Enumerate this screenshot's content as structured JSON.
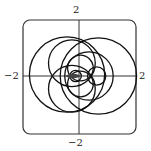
{
  "chart_data": {
    "type": "line",
    "title": "",
    "xlabel": "",
    "ylabel": "",
    "xlim": [
      -2,
      2
    ],
    "ylim": [
      -2,
      2
    ],
    "grid": false,
    "legend": null,
    "tick_labels": {
      "x_min": "−2",
      "x_max": "2",
      "y_min": "−2",
      "y_max": "2"
    },
    "curves": [
      {
        "name": "large-right-loop",
        "cx": 0.68,
        "cy": 0.0,
        "r": 1.34
      },
      {
        "name": "large-left-loop",
        "cx": -0.42,
        "cy": 0.05,
        "r": 1.32
      },
      {
        "name": "medium-upper-left-loop",
        "cx": -0.25,
        "cy": 0.45,
        "r": 0.82
      },
      {
        "name": "medium-lower-left-loop",
        "cx": -0.25,
        "cy": -0.45,
        "r": 0.82
      },
      {
        "name": "medium-right-loop",
        "cx": 0.35,
        "cy": 0.0,
        "r": 0.85
      },
      {
        "name": "small-upper-loop",
        "cx": 0.05,
        "cy": 0.28,
        "r": 0.45
      },
      {
        "name": "small-lower-loop",
        "cx": 0.05,
        "cy": -0.28,
        "r": 0.45
      },
      {
        "name": "small-right-loop",
        "cx": 0.62,
        "cy": 0.0,
        "r": 0.32
      },
      {
        "name": "tiny-center-loop",
        "cx": -0.12,
        "cy": 0.0,
        "r": 0.2
      }
    ]
  },
  "style": {
    "line_color": "#111111",
    "axis_color": "#333333",
    "frame_color": "#333333",
    "background": "#ffffff"
  }
}
